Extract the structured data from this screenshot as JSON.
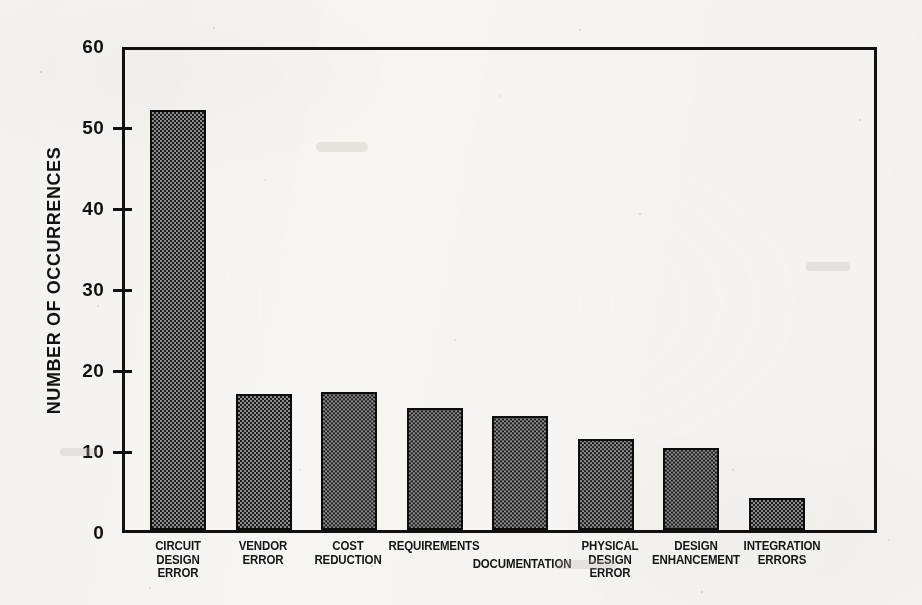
{
  "chart_data": {
    "type": "bar",
    "title": "",
    "xlabel": "",
    "ylabel": "NUMBER OF OCCURRENCES",
    "ylim": [
      0,
      60
    ],
    "yticks": [
      0,
      10,
      20,
      30,
      40,
      50,
      60
    ],
    "ytick_labels": [
      "0",
      "10",
      "20",
      "30",
      "40",
      "50",
      "60"
    ],
    "grid": false,
    "legend": false,
    "bar_fill": "checkerboard-dither",
    "bar_color": "#3a3a3a",
    "bar_edge_color": "#0d0d0d",
    "axis_color": "#111111",
    "background_color": "#f7f5f2",
    "categories": [
      "CIRCUIT\nDESIGN\nERROR",
      "VENDOR\nERROR",
      "COST\nREDUCTION",
      "REQUIREMENTS",
      "DOCUMENTATION",
      "PHYSICAL\nDESIGN\nERROR",
      "DESIGN\nENHANCEMENT",
      "INTEGRATION\nERRORS"
    ],
    "values": [
      52.5,
      17.0,
      17.3,
      15.3,
      14.3,
      11.4,
      10.2,
      4.0
    ],
    "label_layout": [
      {
        "center": 178,
        "top": 0,
        "width": 106
      },
      {
        "center": 263,
        "top": 0,
        "width": 100
      },
      {
        "center": 348,
        "top": 0,
        "width": 116
      },
      {
        "center": 434,
        "top": 0,
        "width": 140
      },
      {
        "center": 522,
        "top": 18,
        "width": 156
      },
      {
        "center": 610,
        "top": 0,
        "width": 106
      },
      {
        "center": 696,
        "top": 0,
        "width": 140
      },
      {
        "center": 782,
        "top": 0,
        "width": 124
      }
    ]
  }
}
